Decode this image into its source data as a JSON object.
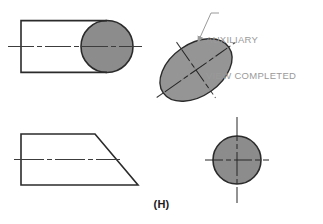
{
  "figure": {
    "plate_label": "(H)",
    "background_color": "#ffffff",
    "line_color": "#2b2b2b",
    "centerline_color": "#4a4a4a",
    "shade_color": "#8c8c8c",
    "note_color": "#9a9a9a"
  },
  "annotation": {
    "line1": "AUXILIARY",
    "line2": "VIEW COMPLETED",
    "leader_name": "leader-line-to-auxiliary-ellipse"
  },
  "views": {
    "top_left": {
      "name": "front-view-cylinder",
      "shape": "rectangle-with-circular-end",
      "rectangle": {
        "x": 21,
        "y": 21,
        "width": 90,
        "height": 51
      },
      "circle": {
        "cx": 107,
        "cy": 46.5,
        "r": 26
      },
      "centerline": {
        "x1": 8,
        "y1": 46.5,
        "x2": 142,
        "y2": 46.5
      }
    },
    "top_right": {
      "name": "auxiliary-view-ellipse",
      "shape": "inclined-ellipse",
      "ellipse": {
        "cx": 196,
        "cy": 70,
        "rx": 40,
        "ry": 26,
        "rotation_deg": -35
      },
      "centerlines": [
        {
          "name": "major-axis-centerline",
          "angle_deg": -35
        },
        {
          "name": "minor-axis-centerline",
          "angle_deg": 55
        }
      ]
    },
    "bottom_left": {
      "name": "top-view-trapezoid",
      "shape": "trapezoid",
      "points": "21,134 95,134 138,185 21,185",
      "centerline": {
        "x1": 14,
        "y1": 159.5,
        "x2": 120,
        "y2": 159.5
      }
    },
    "bottom_right": {
      "name": "side-view-circle",
      "shape": "circle",
      "circle": {
        "cx": 237,
        "cy": 160,
        "r": 24
      },
      "centerlines": [
        {
          "name": "horizontal-centerline",
          "x1": 205,
          "y1": 160,
          "x2": 269,
          "y2": 160
        },
        {
          "name": "vertical-centerline",
          "x1": 237,
          "y1": 117,
          "x2": 237,
          "y2": 203
        }
      ]
    }
  }
}
